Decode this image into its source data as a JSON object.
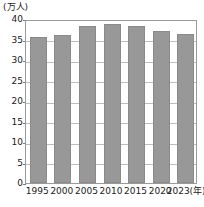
{
  "chart_data": {
    "type": "bar",
    "title": "",
    "subtitle": "",
    "xlabel": "(年)",
    "ylabel": "(万人)",
    "unit_label": "(万人)",
    "categories": [
      "1995",
      "2000",
      "2005",
      "2010",
      "2015",
      "2020",
      "2023"
    ],
    "x_tick_labels": [
      "1995",
      "2000",
      "2005",
      "2010",
      "2015",
      "2020",
      "2023(年)"
    ],
    "values": [
      35.6,
      36.1,
      38.3,
      38.9,
      38.4,
      37.1,
      36.3
    ],
    "ylim": [
      0,
      40
    ],
    "y_ticks": [
      0,
      5,
      10,
      15,
      20,
      25,
      30,
      35,
      40
    ],
    "y_tick_labels": [
      "0",
      "5",
      "10",
      "15",
      "20",
      "25",
      "30",
      "35",
      "40"
    ],
    "grid": true,
    "grid_axis": "y",
    "legend": false,
    "legend_position": "none",
    "bar_color": "#989898",
    "grid_color": "#bdbdbd",
    "frame_color": "#9a9a9a",
    "text_color": "#1a1a1a",
    "background": "#ffffff"
  }
}
